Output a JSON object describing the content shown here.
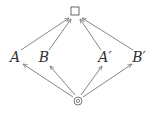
{
  "diagram": {
    "type": "hasse-diagram",
    "colors": {
      "edge": "#666666",
      "text": "#333333",
      "background": "#ffffff"
    },
    "nodes": [
      {
        "id": "top",
        "label": "□",
        "symbol": "square",
        "x": 75,
        "y": 13
      },
      {
        "id": "A",
        "label": "A",
        "x": 15,
        "y": 58
      },
      {
        "id": "B",
        "label": "B",
        "x": 44,
        "y": 58
      },
      {
        "id": "Ap",
        "label": "A′",
        "x": 105,
        "y": 58
      },
      {
        "id": "Bp",
        "label": "B′",
        "x": 139,
        "y": 58
      },
      {
        "id": "bottom",
        "label": "⊙",
        "symbol": "circled-dot",
        "x": 78,
        "y": 101
      }
    ],
    "edges": [
      {
        "from": "A",
        "to": "top"
      },
      {
        "from": "B",
        "to": "top"
      },
      {
        "from": "Ap",
        "to": "top"
      },
      {
        "from": "Bp",
        "to": "top"
      },
      {
        "from": "bottom",
        "to": "A"
      },
      {
        "from": "bottom",
        "to": "B"
      },
      {
        "from": "bottom",
        "to": "Ap"
      },
      {
        "from": "bottom",
        "to": "Bp"
      }
    ]
  }
}
